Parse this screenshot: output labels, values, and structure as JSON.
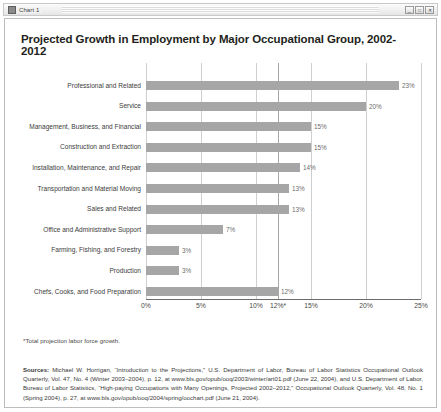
{
  "window": {
    "title": "Chart 1",
    "icon": "chart-window-icon",
    "buttons": [
      "_",
      "□",
      "✕"
    ]
  },
  "chart_data": {
    "type": "bar",
    "orientation": "horizontal",
    "title": "Projected Growth in Employment by Major Occupational Group, 2002-2012",
    "xlabel": "",
    "ylabel": "",
    "xlim": [
      0,
      25
    ],
    "grid": true,
    "legend": "none",
    "bar_color": "#a6a6a6",
    "categories": [
      "Professional and Related",
      "Service",
      "Management, Business, and Financial",
      "Construction and Extraction",
      "Installation, Maintenance, and Repair",
      "Transportation and Material Moving",
      "Sales and Related",
      "Office and Administrative Support",
      "Farming, Fishing, and Forestry",
      "Production",
      "Chefs, Cooks, and Food Preparation"
    ],
    "values": [
      23,
      20,
      15,
      15,
      14,
      13,
      13,
      7,
      3,
      3,
      12
    ],
    "data_labels": [
      "23%",
      "20%",
      "15%",
      "15%",
      "14%",
      "13%",
      "13%",
      "7%",
      "3%",
      "3%",
      "12%"
    ],
    "tick_values": [
      0,
      5,
      10,
      12,
      15,
      20,
      25
    ],
    "tick_labels": [
      "0%",
      "5%",
      "10%",
      "12%*",
      "15%",
      "20%",
      "25%"
    ],
    "reference_line": {
      "value": 12,
      "label": "12%*"
    },
    "annotations": [
      "*Total projection labor force growth."
    ]
  },
  "notes": {
    "footnote": "*Total projection labor force growth.",
    "sources_label": "Sources:",
    "sources_text": " Michael W. Horrigan, “Introduction to the Projections,” U.S. Department of Labor, Bureau of Labor Statistics Occupational Outlook Quarterly, Vol. 47, No. 4 (Winter 2003–2004), p. 12, at www.bls.gov/opub/ooq/2003/winter/art01.pdf (June 22, 2004), and U.S. Department of Labor, Bureau of Labor Statistics, “High-paying Occupations with Many Openings, Projected 2002–2012,” Occupational Outlook Quarterly, Vol. 48, No. 1 (Spring 2004), p. 27, at www.bls.gov/opub/ooq/2004/spring/oochart.pdf (June 21, 2004)."
  }
}
